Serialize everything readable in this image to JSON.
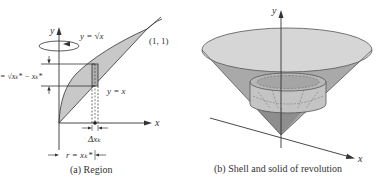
{
  "panel_a": {
    "caption": "(a) Region",
    "axis_x_label": "x",
    "axis_y_label": "y",
    "curve_upper_label": "y = √x",
    "curve_lower_label": "y = x",
    "point_label": "(1, 1)",
    "height_label": "h = √xₖ* − xₖ*",
    "width_label": "Δxₖ",
    "radius_label": "r = xₖ*",
    "icons": {
      "rotation": "rotation-arrow-icon"
    },
    "colors": {
      "region_fill": "#c8c8c8",
      "line": "#333333"
    }
  },
  "panel_b": {
    "caption": "(b) Shell and solid of revolution",
    "axis_x_label": "x",
    "axis_y_label": "y",
    "colors": {
      "cone_top": "#d4d4d4",
      "cone_side": "#a8a8a8",
      "cone_tip": "#8a8a8a",
      "shell": "#bdbdbd"
    }
  }
}
